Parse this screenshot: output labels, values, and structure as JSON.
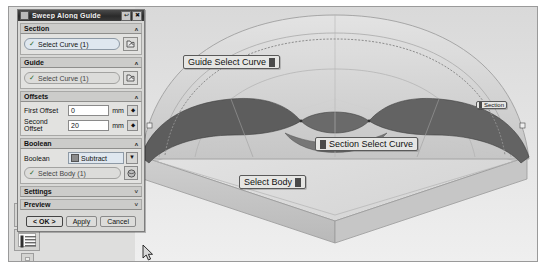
{
  "app": {
    "dialog": {
      "title": "Sweep Along Guide",
      "title_icon": "dialog-menu-icon",
      "buttons": {
        "restore": "↩",
        "close": "✖"
      },
      "groups": [
        {
          "name": "section",
          "header": "Section",
          "chevron": "ʌ",
          "select_label": "Select Curve (1)",
          "check": "✓",
          "pick_icon": "curve-pick-icon"
        },
        {
          "name": "guide",
          "header": "Guide",
          "chevron": "ʌ",
          "select_label": "Select Curve (1)",
          "check": "✓",
          "pick_icon": "curve-pick-icon"
        }
      ],
      "offsets": {
        "header": "Offsets",
        "chevron": "ʌ",
        "first_label": "First Offset",
        "first_value": "0",
        "first_unit": "mm",
        "second_label": "Second Offset",
        "second_value": "20",
        "second_unit": "mm",
        "spinner": "⬥"
      },
      "boolean": {
        "header": "Boolean",
        "chevron": "ʌ",
        "row_label": "Boolean",
        "selected": "Subtract",
        "dropdown_arrow": "▼",
        "select_body_label": "Select Body (1)",
        "check": "✓",
        "body_icon": "solid-body-icon"
      },
      "settings": {
        "header": "Settings",
        "chevron": "˅"
      },
      "preview": {
        "header": "Preview",
        "chevron": "˅"
      },
      "actions": {
        "ok": "< OK >",
        "apply": "Apply",
        "cancel": "Cancel"
      }
    },
    "left_toolbar": {
      "items": [
        {
          "name": "resource-bar-icon"
        },
        {
          "name": "part-navigator-icon"
        },
        {
          "name": "history-icon"
        }
      ]
    },
    "viewport": {
      "callouts": [
        {
          "name": "guide-select-curve",
          "label": "Guide Select Curve",
          "icon": "curve-pick-icon"
        },
        {
          "name": "section-select-curve",
          "label": "Section Select Curve",
          "icon": "curve-pick-icon"
        },
        {
          "name": "select-body",
          "label": "Select Body",
          "icon": "solid-body-icon"
        },
        {
          "name": "section-tag",
          "label": "Section",
          "icon": "section-marker-icon"
        }
      ],
      "cursor": "arrow-cursor"
    },
    "colors": {
      "dialog_bg": "#d8d8d6",
      "titlebar": "#2a2a2a",
      "select_field": "#dfe7ef",
      "swept_cut": "#5f5f5f",
      "body_light": "#d7d7d7",
      "body_shadow": "#bdbdbd"
    }
  }
}
